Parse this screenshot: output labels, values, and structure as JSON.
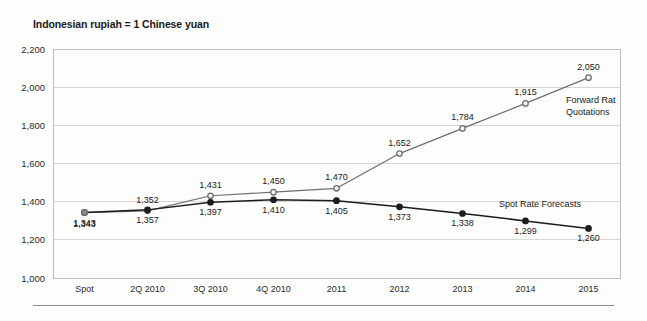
{
  "figure": {
    "title": "Indonesian rupiah = 1 Chinese yuan",
    "bottom_rule": true
  },
  "chart_data": {
    "type": "line",
    "title": "Indonesian rupiah = 1 Chinese yuan",
    "xlabel": "",
    "ylabel": "",
    "ylim": [
      1000,
      2200
    ],
    "ytick_step": 200,
    "ytick_labels": [
      "2,200",
      "2,000",
      "1,800",
      "1,600",
      "1,400",
      "1,200",
      "1,000"
    ],
    "ytick_values": [
      2200,
      2000,
      1800,
      1600,
      1400,
      1200,
      1000
    ],
    "grid": true,
    "legend": "inline-labels",
    "categories": [
      "Spot",
      "2Q 2010",
      "3Q 2010",
      "4Q 2010",
      "2011",
      "2012",
      "2013",
      "2014",
      "2015"
    ],
    "series": [
      {
        "name": "Forward Rat Quotations",
        "color": "#6e6e6e",
        "marker": "open-circle",
        "values": [
          1343,
          1352,
          1431,
          1450,
          1470,
          1652,
          1784,
          1915,
          2050
        ],
        "labels": [
          "1,343",
          "1,352",
          "1,431",
          "1,450",
          "1,470",
          "1,652",
          "1,784",
          "1,915",
          "2,050"
        ]
      },
      {
        "name": "Spot Rate Forecasts",
        "color": "#1c1c1c",
        "marker": "filled-circle",
        "values": [
          1343,
          1357,
          1397,
          1410,
          1405,
          1373,
          1338,
          1299,
          1260
        ],
        "labels": [
          "1,343",
          "1,357",
          "1,397",
          "1,410",
          "1,405",
          "1,373",
          "1,338",
          "1,299",
          "1,260"
        ]
      }
    ],
    "annotations": [
      {
        "name": "forward-series-label-line1",
        "text": "Forward Rat"
      },
      {
        "name": "forward-series-label-line2",
        "text": "Quotations"
      },
      {
        "name": "spot-series-label",
        "text": "Spot Rate Forecasts"
      }
    ]
  }
}
